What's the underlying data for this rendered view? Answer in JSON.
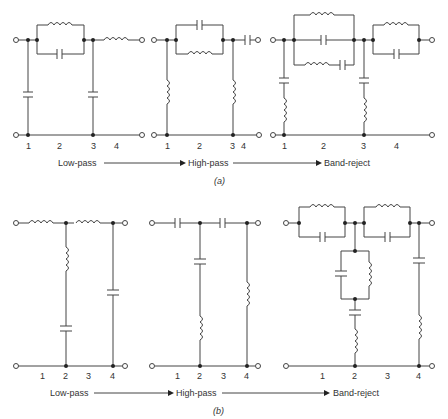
{
  "figure_a": {
    "caption": "(a)",
    "flow": [
      "Low-pass",
      "High-pass",
      "Band-reject"
    ],
    "circuits": [
      {
        "name": "Low-pass",
        "node_labels": [
          "1",
          "2",
          "3",
          "4"
        ]
      },
      {
        "name": "High-pass",
        "node_labels": [
          "1",
          "2",
          "3",
          "4"
        ]
      },
      {
        "name": "Band-reject",
        "node_labels": [
          "1",
          "2",
          "3",
          "4"
        ]
      }
    ]
  },
  "figure_b": {
    "caption": "(b)",
    "flow": [
      "Low-pass",
      "High-pass",
      "Band-reject"
    ],
    "circuits": [
      {
        "name": "Low-pass",
        "node_labels": [
          "1",
          "2",
          "3",
          "4"
        ]
      },
      {
        "name": "High-pass",
        "node_labels": [
          "1",
          "2",
          "3",
          "4"
        ]
      },
      {
        "name": "Band-reject",
        "node_labels": [
          "1",
          "2",
          "3",
          "4"
        ]
      }
    ]
  }
}
